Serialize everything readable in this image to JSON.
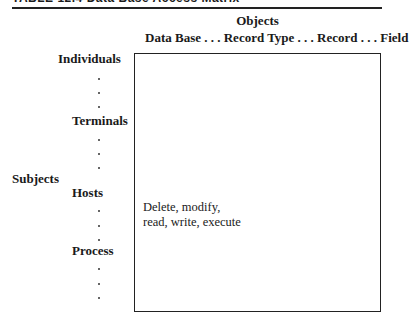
{
  "table": {
    "title": "TABLE 12.4  Data Base Access Matrix",
    "objects_axis_label": "Objects",
    "objects_header": "Data Base . . . Record Type . . . Record . . . Field",
    "subjects_axis_label": "Subjects",
    "subjects": [
      {
        "label": "Individuals"
      },
      {
        "label": "Terminals"
      },
      {
        "label": "Hosts"
      },
      {
        "label": "Process"
      }
    ],
    "cell_text": {
      "line1": "Delete, modify,",
      "line2": "read, write, execute"
    }
  }
}
